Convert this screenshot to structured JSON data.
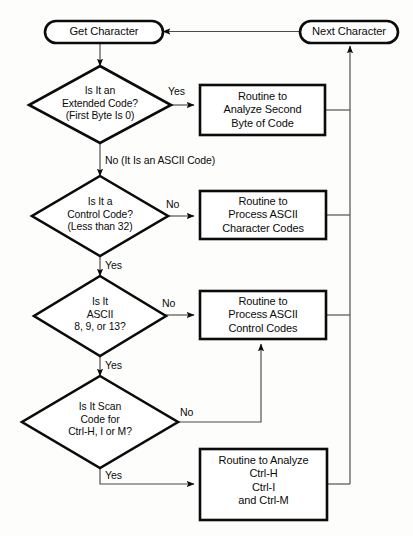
{
  "diagram": {
    "colors": {
      "stroke": "#0b0b0b",
      "fill": "#ffffff",
      "background": "#fdfdfb",
      "thin_stroke": "#3a3a3a"
    },
    "nodes": {
      "get_character": {
        "type": "terminal",
        "label": "Get Character"
      },
      "next_character": {
        "type": "terminal",
        "label": "Next Character"
      },
      "is_extended_code": {
        "type": "decision",
        "label": "Is It an\nExtended Code?\n(First Byte Is 0)"
      },
      "is_control_code": {
        "type": "decision",
        "label": "Is It a\nControl Code?\n(Less than 32)"
      },
      "is_ascii_8_9_13": {
        "type": "decision",
        "label": "Is It\nASCII\n8, 9, or 13?"
      },
      "is_scan_code": {
        "type": "decision",
        "label": "Is It Scan\nCode for\nCtrl-H, I or M?"
      },
      "analyze_second_byte": {
        "type": "process",
        "label": "Routine to\nAnalyze Second\nByte of Code"
      },
      "process_ascii_character": {
        "type": "process",
        "label": "Routine to\nProcess ASCII\nCharacter Codes"
      },
      "process_ascii_control": {
        "type": "process",
        "label": "Routine to\nProcess ASCII\nControl Codes"
      },
      "analyze_ctrl_keys": {
        "type": "process",
        "label": "Routine to Analyze\nCtrl-H\nCtrl-I\nand Ctrl-M"
      }
    },
    "edge_labels": {
      "extended_yes": "Yes",
      "extended_no": "No (It Is an ASCII Code)",
      "control_no": "No",
      "control_yes": "Yes",
      "ascii_no": "No",
      "ascii_yes": "Yes",
      "scan_no": "No",
      "scan_yes": "Yes"
    }
  }
}
